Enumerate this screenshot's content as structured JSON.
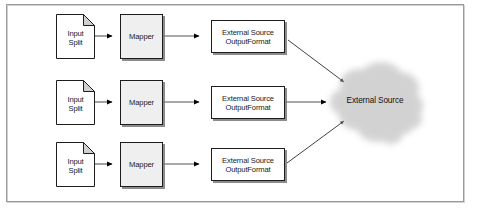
{
  "figure": {
    "frame": {
      "border_color": "#9a9a9a",
      "background": "#ffffff"
    }
  },
  "palette": {
    "node_stroke": "#1d1d1d",
    "mapper_fill": "#efefef",
    "box_fill": "#ffffff",
    "shadow": "#787878",
    "connector": "#555555",
    "arrowhead": "#000000",
    "cloud_fill": "#c8c8c8",
    "text": "#1a1a1a"
  },
  "diagram": {
    "type": "flow",
    "rows": [
      {
        "id": "row-1",
        "input_split": {
          "label": "Input\nSplit"
        },
        "mapper": {
          "label": "Mapper"
        },
        "output_format": {
          "label": "External Source\nOutputFormat"
        }
      },
      {
        "id": "row-2",
        "input_split": {
          "label": "Input\nSplit"
        },
        "mapper": {
          "label": "Mapper"
        },
        "output_format": {
          "label": "External Source\nOutputFormat"
        }
      },
      {
        "id": "row-3",
        "input_split": {
          "label": "Input\nSplit"
        },
        "mapper": {
          "label": "Mapper"
        },
        "output_format": {
          "label": "External Source\nOutputFormat"
        }
      }
    ],
    "sink": {
      "label": "External Source",
      "shape": "cloud"
    },
    "connectors": [
      {
        "from": "input-split-1",
        "to": "mapper-1",
        "style": "straight-arrow"
      },
      {
        "from": "mapper-1",
        "to": "output-format-1",
        "style": "straight-arrow"
      },
      {
        "from": "output-format-1",
        "to": "external-source-cloud",
        "style": "diagonal-arrow"
      },
      {
        "from": "input-split-2",
        "to": "mapper-2",
        "style": "straight-arrow"
      },
      {
        "from": "mapper-2",
        "to": "output-format-2",
        "style": "straight-arrow"
      },
      {
        "from": "output-format-2",
        "to": "external-source-cloud",
        "style": "straight-arrow"
      },
      {
        "from": "input-split-3",
        "to": "mapper-3",
        "style": "straight-arrow"
      },
      {
        "from": "mapper-3",
        "to": "output-format-3",
        "style": "straight-arrow"
      },
      {
        "from": "output-format-3",
        "to": "external-source-cloud",
        "style": "diagonal-arrow"
      }
    ]
  }
}
